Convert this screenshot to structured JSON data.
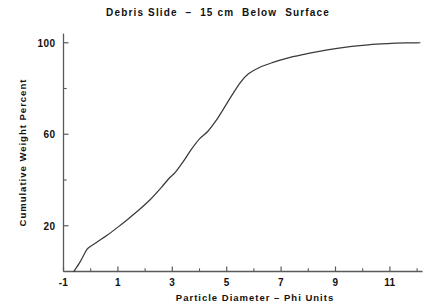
{
  "chart_data": {
    "type": "line",
    "title": "Debris Slide  –  15 cm  Below  Surface",
    "xlabel": "Particle  Diameter  –  Phi Units",
    "ylabel": "Cumulative  Weight  Percent",
    "xlim": [
      -1.3,
      12.2
    ],
    "ylim": [
      0,
      104
    ],
    "grid": false,
    "legend": "none",
    "x_major_ticks": [
      -1,
      1,
      3,
      5,
      7,
      9,
      11
    ],
    "x_major_tick_labels": [
      "-1",
      "1",
      "3",
      "5",
      "7",
      "9",
      "11"
    ],
    "x_minor_ticks": [
      0,
      2,
      4,
      6,
      8,
      10,
      12
    ],
    "y_major_ticks": [
      20,
      60,
      100
    ],
    "y_major_tick_labels": [
      "20",
      "60",
      "100"
    ],
    "y_minor_ticks": [
      40,
      80
    ],
    "series": [
      {
        "name": "Cumulative weight percent",
        "x": [
          -0.62,
          -0.4,
          -0.22,
          -0.1,
          0.2,
          0.6,
          1.0,
          1.4,
          1.8,
          2.2,
          2.6,
          2.9,
          3.1,
          3.4,
          3.7,
          4.0,
          4.3,
          4.6,
          4.9,
          5.2,
          5.5,
          5.8,
          6.2,
          6.7,
          7.2,
          7.8,
          8.4,
          9.0,
          9.6,
          10.2,
          10.9,
          11.6,
          12.1
        ],
        "y": [
          0.0,
          4.0,
          8.0,
          10.2,
          12.6,
          15.8,
          19.4,
          23.2,
          27.2,
          31.6,
          36.8,
          41.0,
          43.2,
          48.0,
          53.4,
          58.0,
          61.2,
          65.8,
          71.4,
          77.2,
          82.6,
          86.4,
          89.2,
          91.4,
          93.2,
          94.8,
          96.2,
          97.4,
          98.4,
          99.1,
          99.6,
          99.9,
          100.0
        ],
        "color": "#3a3a3a"
      }
    ]
  }
}
